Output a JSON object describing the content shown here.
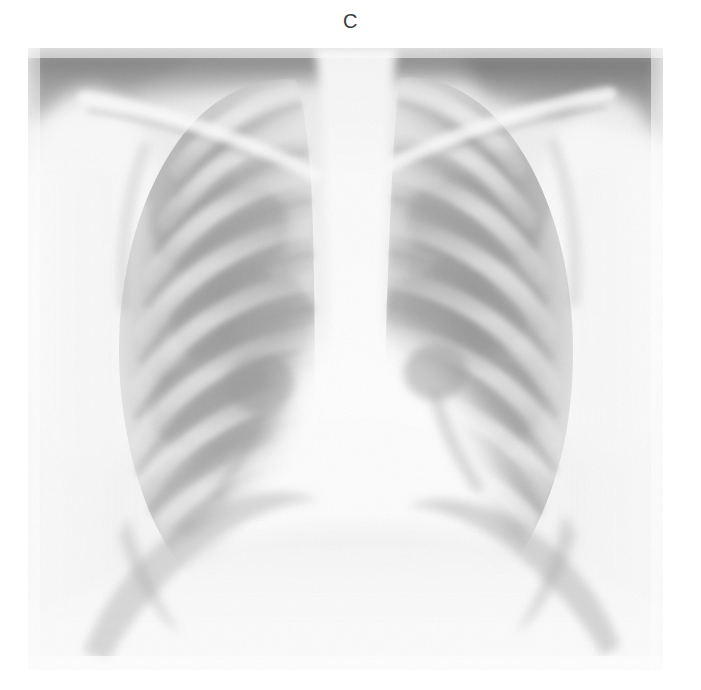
{
  "figure": {
    "panel_label": "C",
    "modality_name": "chest-radiograph",
    "view": "frontal",
    "background_color": "#ffffff",
    "label_color": "#3b3b3b",
    "image_bounds": {
      "x": 28,
      "y": 48,
      "width": 635,
      "height": 622
    },
    "tone": {
      "film_base": "#f2f2f2",
      "soft_tissue": "#ededed",
      "mediastinum": "#fbfbfb",
      "lung_field": "#a8a8a8",
      "rib_bone": "#d2d2d2",
      "dark_apex": "#6f6f6f",
      "deep_shadow": "#8a8a8a"
    },
    "anatomy": [
      {
        "name": "right-lung-field",
        "side": "right"
      },
      {
        "name": "left-lung-field",
        "side": "left"
      },
      {
        "name": "mediastinum-spine",
        "side": "center"
      },
      {
        "name": "cardiac-silhouette",
        "side": "center"
      },
      {
        "name": "right-hemidiaphragm",
        "side": "right"
      },
      {
        "name": "left-hemidiaphragm",
        "side": "left"
      },
      {
        "name": "right-clavicle",
        "side": "right"
      },
      {
        "name": "left-clavicle",
        "side": "left"
      },
      {
        "name": "posterior-ribs",
        "side": "both"
      },
      {
        "name": "right-costophrenic-angle",
        "side": "right"
      },
      {
        "name": "left-costophrenic-angle",
        "side": "left"
      }
    ]
  }
}
